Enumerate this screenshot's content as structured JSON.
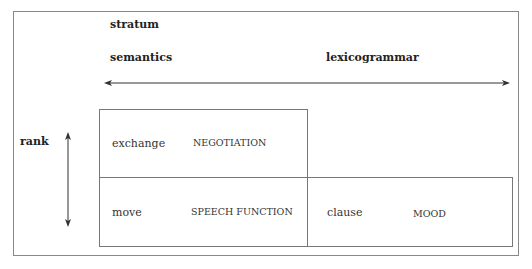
{
  "stratum_label": "stratum",
  "strata": [
    "semantics",
    "lexicogrammar"
  ],
  "rank_label": "rank",
  "cells": [
    {
      "unit": "exchange",
      "system": "NEGOTIATION"
    },
    {
      "unit": "move",
      "system": "SPEECH FUNCTION"
    },
    {
      "unit": "clause",
      "system": "MOOD"
    }
  ]
}
